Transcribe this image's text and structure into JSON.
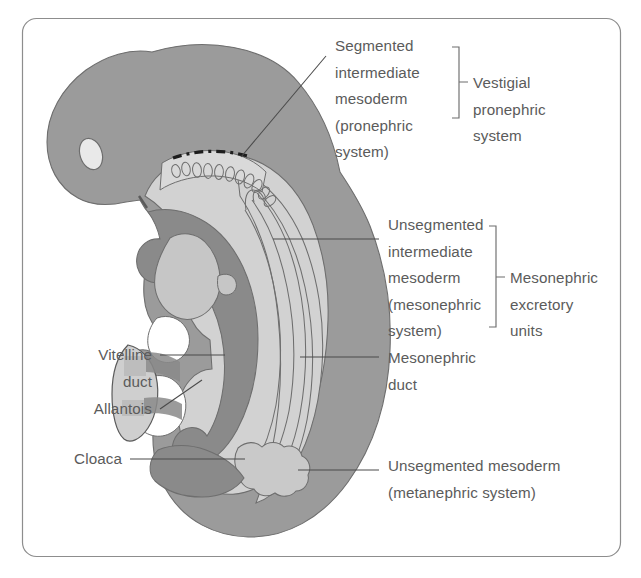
{
  "figure": {
    "frame": {
      "border_color": "#8d8d8d",
      "background": "#ffffff",
      "radius": 14
    },
    "palette": {
      "body_gray": "#9b9b9b",
      "mid_gray": "#8e8e8e",
      "light_gray": "#d2d2d2",
      "pale_gray": "#c6c6c6",
      "dark_gray": "#7e7e7e",
      "eye_fill": "#e9e9e9",
      "outline": "#6e6e6e",
      "text": "#5b5b5b",
      "leader": "#4a4a4a",
      "dash_line": "#1d1d1d"
    }
  },
  "labels": {
    "segmented": {
      "name": "segmented-intermediate-mesoderm",
      "lines": [
        "Segmented",
        "intermediate",
        "mesoderm",
        "(pronephric",
        "system)"
      ],
      "x": 335,
      "y_start": 51,
      "line_height": 26.5
    },
    "vestigial": {
      "name": "vestigial-pronephric-system",
      "lines": [
        "Vestigial",
        "pronephric",
        "system"
      ],
      "x": 480,
      "y_start": 88,
      "line_height": 26.5
    },
    "unsegmented_intermediate": {
      "name": "unsegmented-intermediate-mesoderm",
      "lines": [
        "Unsegmented",
        "intermediate",
        "mesoderm",
        "(mesonephric",
        "system)"
      ],
      "x": 388,
      "y_start": 230,
      "line_height": 26.5
    },
    "mesonephric_units": {
      "name": "mesonephric-excretory-units",
      "lines": [
        "Mesonephric",
        "excretory",
        "units"
      ],
      "x": 515,
      "y_start": 283,
      "line_height": 26.5
    },
    "mesonephric_duct": {
      "name": "mesonephric-duct",
      "lines": [
        "Mesonephric",
        "duct"
      ],
      "x": 388,
      "y_start": 366,
      "line_height": 26.5
    },
    "vitelline_duct": {
      "name": "vitelline-duct",
      "lines": [
        "Vitelline",
        "duct"
      ],
      "x_right": 152,
      "y_start": 360,
      "line_height": 26.5
    },
    "allantois": {
      "name": "allantois",
      "lines": [
        "Allantois"
      ],
      "x_right": 152,
      "y_start": 414,
      "line_height": 26.5
    },
    "cloaca": {
      "name": "cloaca",
      "lines": [
        "Cloaca"
      ],
      "x_right": 122,
      "y_start": 464,
      "line_height": 26.5
    },
    "unsegmented_meta": {
      "name": "unsegmented-mesoderm-metanephric",
      "lines": [
        "Unsegmented mesoderm",
        "(metanephric system)"
      ],
      "x": 388,
      "y_start": 471,
      "line_height": 26.5
    }
  },
  "structures": {
    "eye": {
      "name": "eye-vesicle",
      "cx": 91,
      "cy": 154,
      "rx": 11,
      "ry": 16,
      "rotation": -18
    },
    "dashed_line": {
      "name": "pronephric-dashed-marker",
      "color": "#1d1d1d"
    },
    "pronephric_tubules_count": 11,
    "mesonephric_duct_lines": 4
  }
}
